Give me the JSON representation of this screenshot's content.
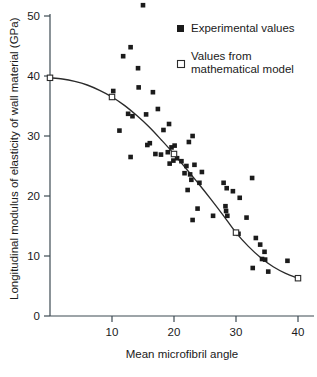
{
  "chart_data": {
    "type": "scatter",
    "title": "",
    "xlabel": "Mean microfibril angle",
    "ylabel": "Longitudinal modulus of elasticity of wall material (GPa)",
    "xlim": [
      0,
      43.5
    ],
    "ylim": [
      0,
      52.5
    ],
    "xticks": [
      10,
      20,
      30,
      40
    ],
    "yticks": [
      0,
      10,
      20,
      30,
      40,
      50
    ],
    "xtick_labels": [
      "10",
      "20",
      "30",
      "40"
    ],
    "ytick_labels": [
      "0",
      "10",
      "20",
      "30",
      "40",
      "50"
    ],
    "grid": false,
    "legend_position": "top-right",
    "series": [
      {
        "name": "Experimental values",
        "marker": "filled-square",
        "color": "#1b1b1b",
        "points": [
          [
            15.0,
            51.8
          ],
          [
            13.0,
            44.8
          ],
          [
            11.8,
            43.3
          ],
          [
            14.2,
            41.3
          ],
          [
            10.2,
            37.5
          ],
          [
            14.3,
            38.1
          ],
          [
            16.6,
            37.3
          ],
          [
            13.3,
            33.3
          ],
          [
            12.6,
            33.7
          ],
          [
            15.5,
            33.6
          ],
          [
            17.4,
            34.5
          ],
          [
            11.2,
            30.9
          ],
          [
            18.3,
            31.0
          ],
          [
            19.2,
            32.0
          ],
          [
            16.1,
            28.8
          ],
          [
            15.7,
            28.5
          ],
          [
            13.0,
            26.5
          ],
          [
            17.0,
            27.0
          ],
          [
            17.9,
            26.9
          ],
          [
            19.0,
            27.3
          ],
          [
            19.6,
            28.1
          ],
          [
            20.1,
            28.4
          ],
          [
            22.4,
            29.0
          ],
          [
            23.0,
            30.0
          ],
          [
            19.3,
            25.4
          ],
          [
            19.9,
            25.9
          ],
          [
            20.5,
            26.3
          ],
          [
            21.2,
            25.8
          ],
          [
            22.0,
            25.0
          ],
          [
            23.3,
            25.2
          ],
          [
            21.7,
            23.8
          ],
          [
            22.6,
            23.6
          ],
          [
            22.8,
            22.7
          ],
          [
            24.5,
            24.0
          ],
          [
            24.1,
            22.2
          ],
          [
            22.2,
            21.0
          ],
          [
            28.0,
            22.2
          ],
          [
            28.5,
            21.3
          ],
          [
            29.5,
            20.8
          ],
          [
            30.6,
            19.7
          ],
          [
            32.6,
            23.0
          ],
          [
            23.8,
            17.9
          ],
          [
            26.3,
            16.7
          ],
          [
            28.3,
            18.3
          ],
          [
            28.4,
            17.5
          ],
          [
            28.6,
            16.7
          ],
          [
            23.0,
            16.0
          ],
          [
            31.7,
            16.4
          ],
          [
            30.4,
            13.7
          ],
          [
            33.2,
            13.0
          ],
          [
            33.9,
            11.9
          ],
          [
            34.6,
            10.7
          ],
          [
            34.2,
            9.5
          ],
          [
            34.7,
            9.4
          ],
          [
            38.3,
            9.2
          ],
          [
            32.7,
            8.0
          ],
          [
            35.2,
            7.4
          ]
        ]
      },
      {
        "name": "Values from mathematical model",
        "marker": "open-square",
        "color": "#ffffff",
        "points": [
          [
            0.0,
            39.7
          ],
          [
            10.0,
            36.5
          ],
          [
            20.0,
            27.0
          ],
          [
            30.0,
            13.9
          ],
          [
            40.0,
            6.3
          ]
        ]
      }
    ],
    "fit_curve": {
      "name": "mathematical model curve",
      "points": [
        [
          0.0,
          39.7
        ],
        [
          2.0,
          39.5
        ],
        [
          4.0,
          39.1
        ],
        [
          6.0,
          38.5
        ],
        [
          8.0,
          37.6
        ],
        [
          10.0,
          36.5
        ],
        [
          12.0,
          35.1
        ],
        [
          14.0,
          33.4
        ],
        [
          16.0,
          31.5
        ],
        [
          18.0,
          29.3
        ],
        [
          20.0,
          27.0
        ],
        [
          22.0,
          24.5
        ],
        [
          24.0,
          22.0
        ],
        [
          26.0,
          19.4
        ],
        [
          28.0,
          16.7
        ],
        [
          30.0,
          13.9
        ],
        [
          32.0,
          11.6
        ],
        [
          34.0,
          9.7
        ],
        [
          36.0,
          8.2
        ],
        [
          38.0,
          7.1
        ],
        [
          40.0,
          6.3
        ]
      ]
    },
    "legend": [
      {
        "label": "Experimental values",
        "marker": "filled-square"
      },
      {
        "label": "Values from\nmathematical model",
        "marker": "open-square"
      }
    ]
  },
  "legend_items": {
    "experimental": "Experimental values",
    "model_line1": "Values from",
    "model_line2": "mathematical model"
  },
  "axes": {
    "x_title": "Mean microfibril angle",
    "y_title": "Longitudinal modulus of elasticity of wall material (GPa)"
  }
}
